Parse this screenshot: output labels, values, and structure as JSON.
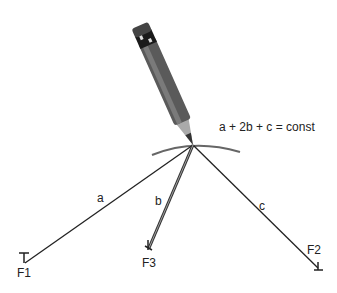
{
  "diagram": {
    "equation": "a + 2b + c = const",
    "segments": [
      {
        "label": "a"
      },
      {
        "label": "b"
      },
      {
        "label": "c"
      }
    ],
    "foci": [
      {
        "label": "F1"
      },
      {
        "label": "F2"
      },
      {
        "label": "F3"
      }
    ],
    "colors": {
      "line": "#222222",
      "curve": "#666666",
      "pencil": "#555555"
    }
  }
}
